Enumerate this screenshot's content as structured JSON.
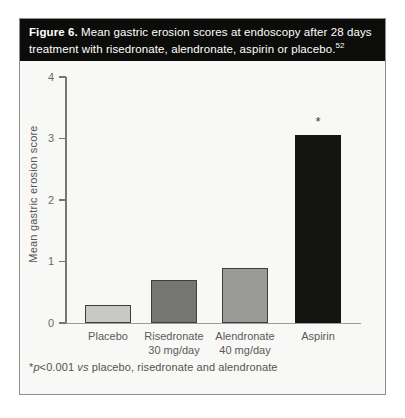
{
  "figure": {
    "caption_label": "Figure 6.",
    "caption_text": " Mean gastric erosion scores at endoscopy after 28 days treatment with risedronate, alendronate, aspirin or placebo.",
    "caption_ref": "52"
  },
  "chart_data": {
    "type": "bar",
    "categories": [
      "Placebo",
      "Risedronate 30 mg/day",
      "Alendronate 40 mg/day",
      "Aspirin"
    ],
    "category_lines": [
      [
        "Placebo"
      ],
      [
        "Risedronate",
        "30 mg/day"
      ],
      [
        "Alendronate",
        "40 mg/day"
      ],
      [
        "Aspirin"
      ]
    ],
    "values": [
      0.3,
      0.7,
      0.9,
      3.05
    ],
    "title": "",
    "xlabel": "",
    "ylabel": "Mean gastric erosion score",
    "ylim": [
      0,
      4
    ],
    "yticks": [
      0,
      1,
      2,
      3,
      4
    ],
    "grid": false,
    "legend": "none",
    "bar_colors": [
      "#c8c8c6",
      "#757573",
      "#9a9a98",
      "#141412"
    ],
    "annotations": [
      {
        "text": "*",
        "category_index": 3
      }
    ]
  },
  "footnote": {
    "star": "*",
    "p": "p",
    "value": "<0.001 ",
    "vs": "vs",
    "tail": " placebo, risedronate and alendronate"
  }
}
